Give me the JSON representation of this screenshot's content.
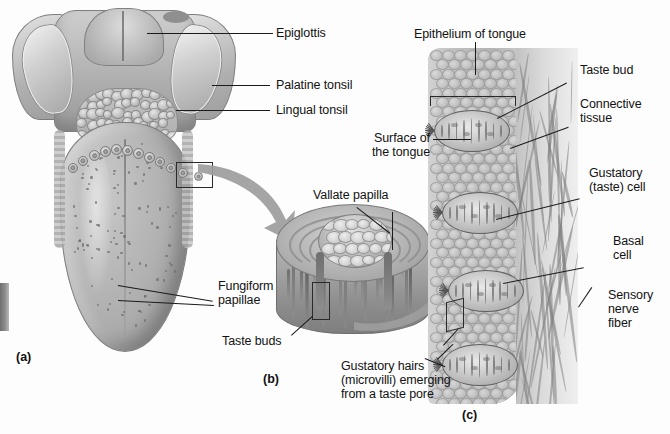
{
  "figure": {
    "background_color": "#fdfdfd",
    "line_color": "#1a1a1a"
  },
  "panels": [
    {
      "id": "a",
      "label": "(a)",
      "description": "Dorsal surface of the tongue"
    },
    {
      "id": "b",
      "label": "(b)",
      "description": "Sectioned vallate papilla"
    },
    {
      "id": "c",
      "label": "(c)",
      "description": "Taste buds in tongue epithelium"
    }
  ],
  "panel_a": {
    "label": "(a)",
    "labels": [
      {
        "name": "epiglottis",
        "text": "Epiglottis"
      },
      {
        "name": "palatine-tonsil",
        "text": "Palatine tonsil"
      },
      {
        "name": "lingual-tonsil",
        "text": "Lingual tonsil"
      },
      {
        "name": "fungiform-papillae",
        "line1": "Fungiform",
        "line2": "papillae"
      }
    ]
  },
  "panel_b": {
    "label": "(b)",
    "labels": [
      {
        "name": "vallate-papilla",
        "text": "Vallate papilla"
      },
      {
        "name": "taste-buds",
        "text": "Taste buds"
      }
    ]
  },
  "panel_c": {
    "label": "(c)",
    "labels": [
      {
        "name": "epithelium-of-tongue",
        "text": "Epithelium of tongue"
      },
      {
        "name": "taste-bud",
        "text": "Taste bud"
      },
      {
        "name": "connective-tissue",
        "line1": "Connective",
        "line2": "tissue"
      },
      {
        "name": "surface-of-the-tongue",
        "line1": "Surface of",
        "line2": "the tongue"
      },
      {
        "name": "gustatory-taste-cell",
        "line1": "Gustatory",
        "line2": "(taste) cell"
      },
      {
        "name": "basal-cell",
        "line1": "Basal",
        "line2": "cell"
      },
      {
        "name": "sensory-nerve-fiber",
        "line1": "Sensory",
        "line2": "nerve",
        "line3": "fiber"
      },
      {
        "name": "gustatory-hairs",
        "line1": "Gustatory hairs",
        "line2": "(microvilli) emerging",
        "line3": "from a taste pore"
      }
    ]
  }
}
